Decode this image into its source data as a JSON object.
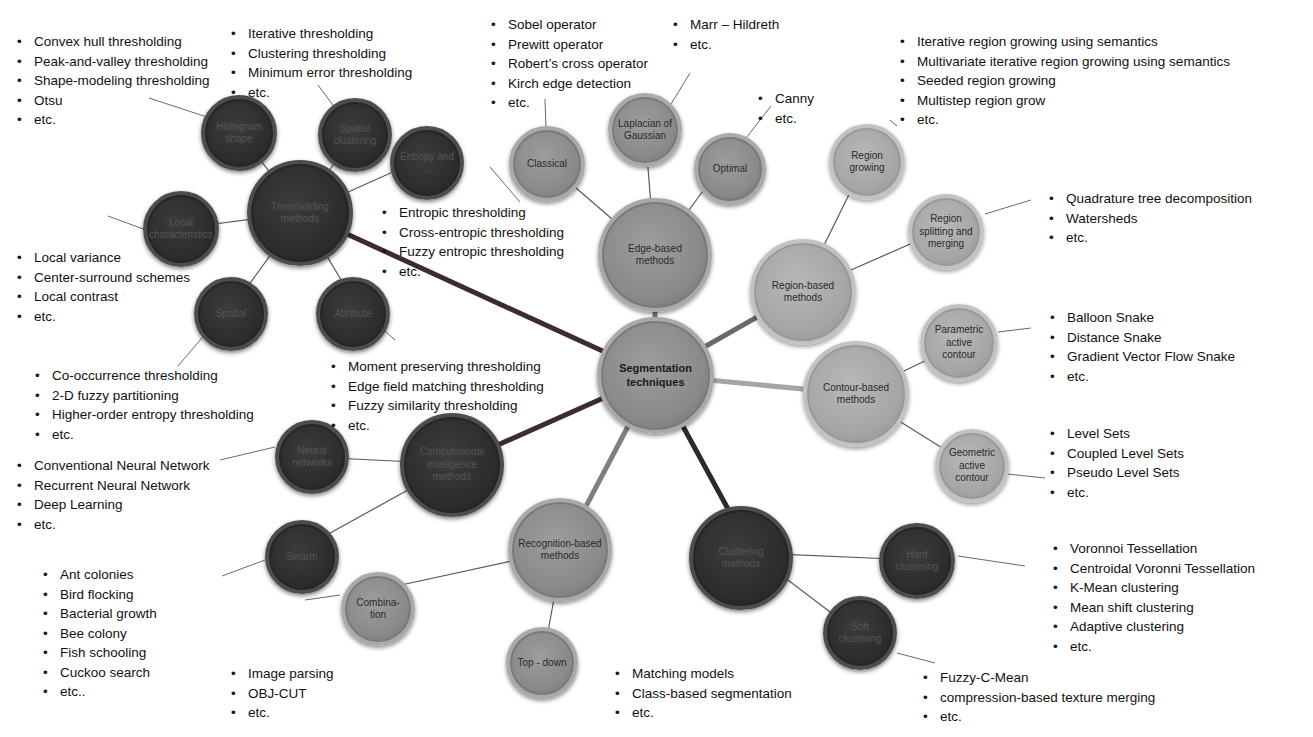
{
  "center": {
    "label": "Segmentation techniques"
  },
  "categories": {
    "thresholding": {
      "label": "Thresholding methods"
    },
    "edge": {
      "label": "Edge-based methods"
    },
    "region": {
      "label": "Region-based methods"
    },
    "contour": {
      "label": "Contour-based methods"
    },
    "clustering": {
      "label": "Clustering methods"
    },
    "recognition": {
      "label": "Recognition-based methods"
    },
    "ci": {
      "label": "Computational intelligence methods"
    }
  },
  "subnodes": {
    "histogram": "Histogram shape",
    "spatial_clustering": "Spatial clustering",
    "entropy": "Entropy and ...",
    "local": "Local characteristics",
    "spatial": "Spatial",
    "attribute": "Attribute",
    "classical": "Classical",
    "log": "Laplacian of Gaussian",
    "optimal": "Optimal",
    "region_growing": "Region growing",
    "region_split": "Region splitting and merging",
    "parametric": "Parametric active contour",
    "geometric": "Geometric active contour",
    "hard": "Hard clustering",
    "soft": "Soft clustering",
    "combination": "Combina-tion",
    "topdown": "Top - down",
    "neural": "Neural networks",
    "swarm": "Swarm"
  },
  "lists": {
    "histogram": [
      "Convex hull thresholding",
      "Peak-and-valley thresholding",
      "Shape-modeling thresholding",
      "Otsu",
      "etc."
    ],
    "spatial_clustering": [
      "Iterative thresholding",
      "Clustering thresholding",
      "Minimum error thresholding",
      "etc."
    ],
    "classical": [
      "Sobel operator",
      "Prewitt operator",
      "Robert’s cross operator",
      "Kirch edge detection",
      "etc."
    ],
    "log": [
      "Marr – Hildreth",
      "etc."
    ],
    "optimal": [
      "Canny",
      "etc."
    ],
    "region_growing": [
      "Iterative region growing using semantics",
      "Multivariate iterative region growing using semantics",
      "Seeded region growing",
      "Multistep region grow",
      "etc."
    ],
    "region_split": [
      "Quadrature tree decomposition",
      "Watersheds",
      "etc."
    ],
    "entropy": [
      "Entropic thresholding",
      "Cross-entropic thresholding",
      "Fuzzy entropic thresholding",
      "etc."
    ],
    "local": [
      "Local variance",
      "Center-surround schemes",
      "Local contrast",
      "etc."
    ],
    "parametric": [
      "Balloon Snake",
      "Distance Snake",
      "Gradient Vector Flow Snake",
      "etc."
    ],
    "attribute": [
      "Moment preserving thresholding",
      "Edge field matching thresholding",
      "Fuzzy similarity thresholding",
      "etc."
    ],
    "spatial": [
      "Co-occurrence thresholding",
      "2-D fuzzy partitioning",
      "Higher-order entropy thresholding",
      "etc."
    ],
    "geometric": [
      "Level Sets",
      "Coupled Level Sets",
      "Pseudo Level Sets",
      "etc."
    ],
    "neural": [
      "Conventional Neural Network",
      "Recurrent Neural Network",
      "Deep Learning",
      "etc."
    ],
    "hard": [
      "Voronnoi Tessellation",
      "Centroidal Voronni Tessellation",
      "K-Mean clustering",
      "Mean shift clustering",
      "Adaptive clustering",
      "etc."
    ],
    "swarm": [
      "Ant colonies",
      "Bird flocking",
      "Bacterial growth",
      "Bee colony",
      "Fish schooling",
      "Cuckoo search",
      "etc.."
    ],
    "combination": [
      "Image parsing",
      "OBJ-CUT",
      "etc."
    ],
    "topdown": [
      "Matching models",
      "Class-based segmentation",
      "etc."
    ],
    "soft": [
      "Fuzzy-C-Mean",
      "compression-based texture merging",
      "etc."
    ]
  },
  "colors": {
    "dark": "#2d2d2d",
    "mid": "#8a8a8a",
    "light": "#a6a6a6",
    "connector_dark": "#3a2a2a",
    "connector_light": "#a8a8a8",
    "leader": "#555555"
  }
}
